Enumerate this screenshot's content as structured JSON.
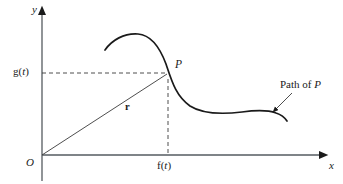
{
  "figure": {
    "background_color": "#ffffff",
    "ink_color": "#1a1a1a",
    "width": 343,
    "height": 184
  },
  "axes": {
    "x_label": "x",
    "y_label": "y",
    "origin_label": "O",
    "x_axis_y": 155,
    "y_axis_x": 42,
    "x_axis_start": 42,
    "x_axis_end": 327,
    "y_axis_top": 8,
    "y_axis_bottom": 181
  },
  "labels": {
    "x_component": "f(t)",
    "x_component_base": "f(",
    "x_component_var": "t",
    "x_component_close": ")",
    "y_component": "g(t)",
    "y_component_base": "g(",
    "y_component_var": "t",
    "y_component_close": ")",
    "point": "P",
    "vector": "r",
    "path_caption_prefix": "Path of ",
    "path_caption_point": "P",
    "path_caption": "Path of P"
  },
  "geometry": {
    "point_P": {
      "x": 168,
      "y": 73
    },
    "origin": {
      "x": 42,
      "y": 155
    },
    "vector_arrow_tip": {
      "x": 122,
      "y": 105
    },
    "path_arrow_tip": {
      "x": 272,
      "y": 112
    },
    "leader_line_start": {
      "x": 292,
      "y": 93
    },
    "leader_line_end": {
      "x": 275,
      "y": 109
    },
    "curve_start": {
      "x": 105,
      "y": 50
    },
    "curve_peak": {
      "x": 138,
      "y": 34
    },
    "curve_end": {
      "x": 287,
      "y": 121
    },
    "dashed_horizontal": {
      "x1": 42,
      "y1": 73,
      "x2": 166,
      "y2": 73
    },
    "dashed_vertical": {
      "x1": 168,
      "y1": 78,
      "x2": 168,
      "y2": 155
    }
  },
  "label_positions": {
    "y_axis": {
      "left": 32,
      "top": 5
    },
    "x_axis": {
      "left": 329,
      "top": 161
    },
    "origin": {
      "left": 27,
      "top": 158
    },
    "g_of_t": {
      "left": 14,
      "top": 67
    },
    "f_of_t": {
      "left": 157,
      "top": 161
    },
    "point_P": {
      "left": 175,
      "top": 60
    },
    "vector_r": {
      "left": 124,
      "top": 103
    },
    "path_caption": {
      "left": 280,
      "top": 80
    }
  }
}
